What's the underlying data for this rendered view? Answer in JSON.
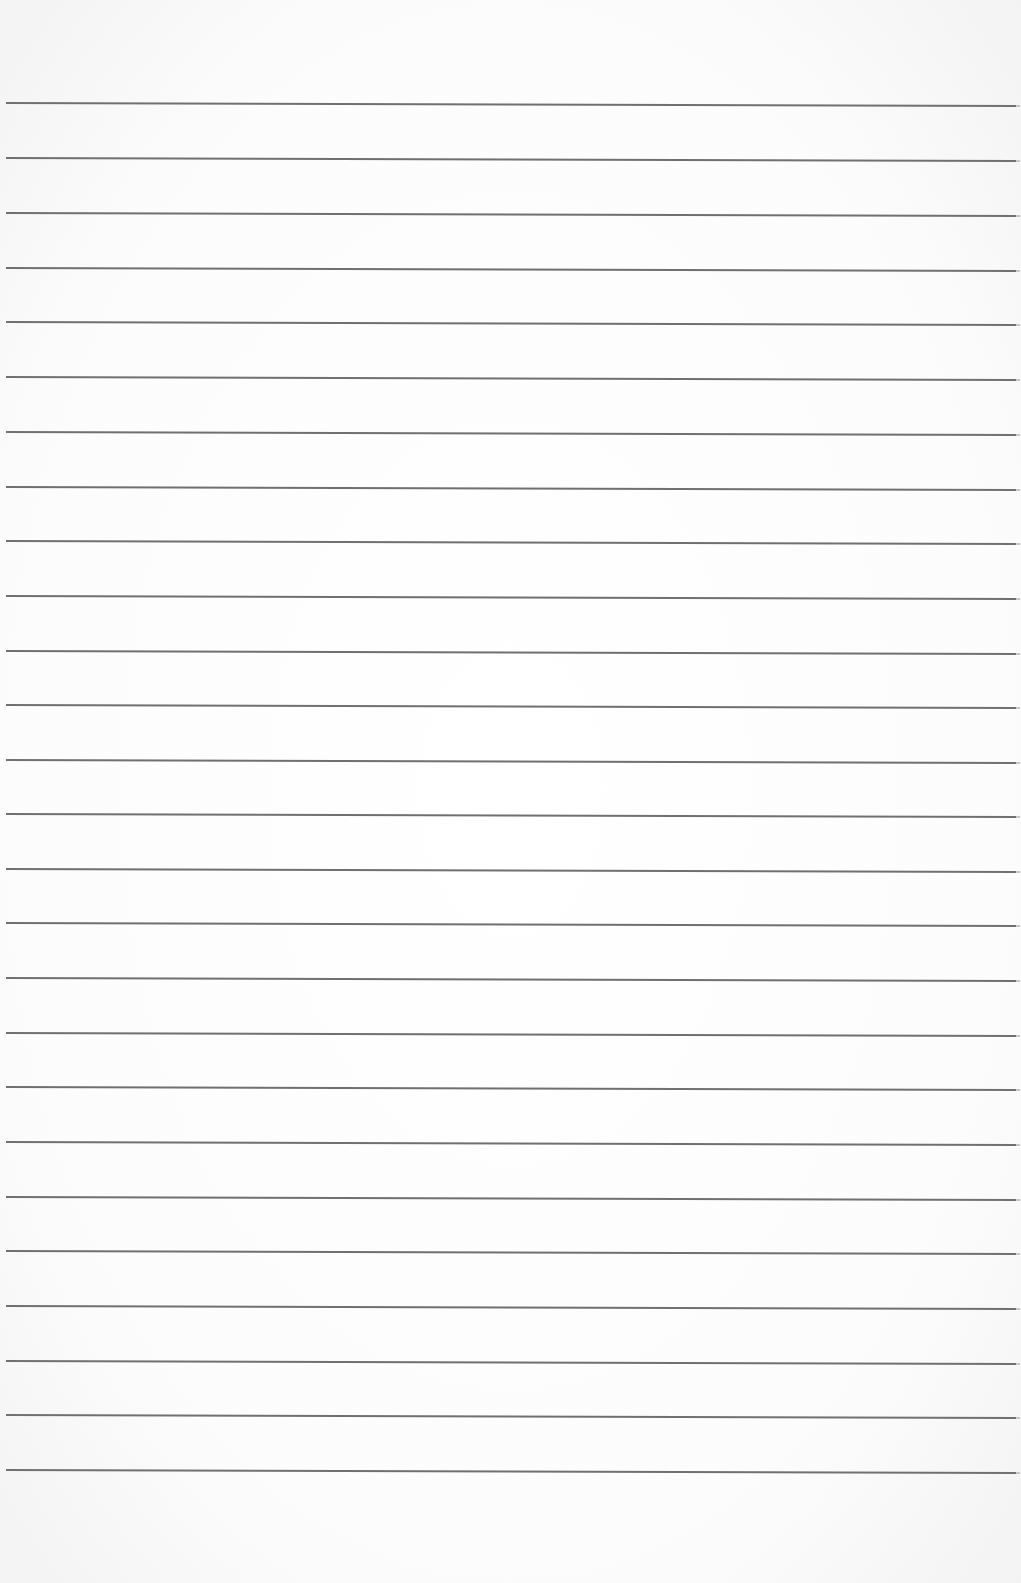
{
  "page": {
    "type": "lined-paper",
    "background_color": "#fbfbfb",
    "line_color": "#707070",
    "line_count": 26,
    "line_positions_y": [
      102,
      157,
      212,
      267,
      321,
      376,
      431,
      486,
      540,
      595,
      650,
      704,
      759,
      813,
      868,
      922,
      977,
      1032,
      1086,
      1141,
      1196,
      1250,
      1305,
      1360,
      1414,
      1469
    ]
  }
}
